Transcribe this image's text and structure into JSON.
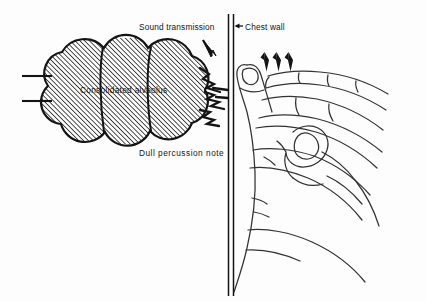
{
  "figure": {
    "background_color": "#fdfdfd",
    "ink_color": "#141414",
    "width": 426,
    "height": 302
  },
  "labels": {
    "sound_transmission": "Sound transmission",
    "chest_wall": "Chest wall",
    "consolidated_alveolus": "Consolidated alveolus",
    "dull_percussion_note": "Dull  percussion  note"
  },
  "parts": {
    "alveolus_name": "consolidated-alveolus",
    "bronchus_name": "bronchus-lines",
    "chest_wall_name": "chest-wall",
    "sound_waves_name": "sound-wave-lines",
    "hand_name": "percussing-hand",
    "arrow_count": 3
  }
}
